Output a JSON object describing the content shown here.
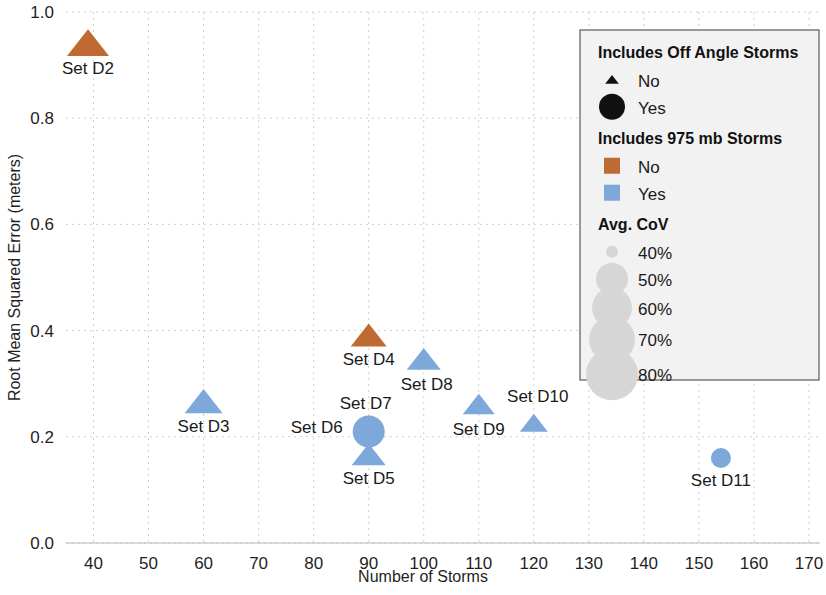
{
  "chart_data": {
    "type": "scatter",
    "title": "",
    "xlabel": "Number of Storms",
    "ylabel": "Root Mean Squared Error (meters)",
    "xlim": [
      35,
      172
    ],
    "ylim": [
      0.0,
      1.0
    ],
    "xticks": [
      40,
      50,
      60,
      70,
      80,
      90,
      100,
      110,
      120,
      130,
      140,
      150,
      160,
      170
    ],
    "yticks": [
      "0.0",
      "0.2",
      "0.4",
      "0.6",
      "0.8",
      "1.0"
    ],
    "grid": true,
    "legend_position": "top-right",
    "colors": {
      "orange": "#bf6a33",
      "blue": "#7ea7da",
      "black": "#111111",
      "grid": "#cfcfcf",
      "legend_bg": "#f2f2f2",
      "legend_border": "#5a5a5a"
    },
    "points": [
      {
        "label": "Set D2",
        "x": 39,
        "y": 0.94,
        "marker": "triangle",
        "color": "#bf6a33",
        "size": 21,
        "label_dx": 0,
        "label_dy": 30
      },
      {
        "label": "Set D3",
        "x": 60,
        "y": 0.265,
        "marker": "triangle",
        "color": "#7ea7da",
        "size": 19,
        "label_dx": 0,
        "label_dy": 30
      },
      {
        "label": "Set D4",
        "x": 90,
        "y": 0.39,
        "marker": "triangle",
        "color": "#bf6a33",
        "size": 18,
        "label_dx": 0,
        "label_dy": 29
      },
      {
        "label": "Set D5",
        "x": 90,
        "y": 0.165,
        "marker": "triangle",
        "color": "#7ea7da",
        "size": 17,
        "label_dx": 0,
        "label_dy": 29
      },
      {
        "label": "Set D6",
        "x": 90,
        "y": 0.21,
        "marker": "none",
        "color": "#7ea7da",
        "size": 0,
        "label_dx": -52,
        "label_dy": 2
      },
      {
        "label": "Set D7",
        "x": 90,
        "y": 0.21,
        "marker": "circle",
        "color": "#7ea7da",
        "size": 16,
        "label_dx": -3,
        "label_dy": -22
      },
      {
        "label": "Set D8",
        "x": 100,
        "y": 0.345,
        "marker": "triangle",
        "color": "#7ea7da",
        "size": 17,
        "label_dx": 3,
        "label_dy": 30
      },
      {
        "label": "Set D9",
        "x": 110,
        "y": 0.26,
        "marker": "triangle",
        "color": "#7ea7da",
        "size": 16,
        "label_dx": 0,
        "label_dy": 30
      },
      {
        "label": "Set D10",
        "x": 120,
        "y": 0.225,
        "marker": "triangle",
        "color": "#7ea7da",
        "size": 14,
        "label_dx": 4,
        "label_dy": -22
      },
      {
        "label": "Set D11",
        "x": 154,
        "y": 0.16,
        "marker": "circle",
        "color": "#7ea7da",
        "size": 10,
        "label_dx": 0,
        "label_dy": 28
      }
    ]
  },
  "legend": {
    "sections": [
      {
        "title": "Includes Off Angle Storms",
        "items": [
          {
            "label": "No",
            "marker": "triangle",
            "color": "#111111",
            "size": 13
          },
          {
            "label": "Yes",
            "marker": "circle",
            "color": "#111111",
            "size": 13
          }
        ]
      },
      {
        "title": "Includes 975 mb Storms",
        "items": [
          {
            "label": "No",
            "marker": "square",
            "color": "#bf6a33",
            "size": 16
          },
          {
            "label": "Yes",
            "marker": "square",
            "color": "#7ea7da",
            "size": 16
          }
        ]
      },
      {
        "title": "Avg. CoV",
        "items": [
          {
            "label": "40%",
            "marker": "circle",
            "color": "#d6d6d6",
            "size": 6
          },
          {
            "label": "50%",
            "marker": "circle",
            "color": "#d6d6d6",
            "size": 16
          },
          {
            "label": "60%",
            "marker": "circle",
            "color": "#d6d6d6",
            "size": 20
          },
          {
            "label": "70%",
            "marker": "circle",
            "color": "#d6d6d6",
            "size": 23
          },
          {
            "label": "80%",
            "marker": "circle",
            "color": "#d6d6d6",
            "size": 26
          }
        ]
      }
    ]
  }
}
